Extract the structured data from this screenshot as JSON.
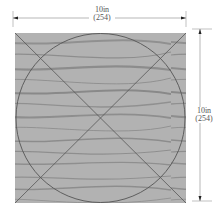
{
  "diagram": {
    "width_dimension": {
      "imperial": "10in",
      "metric": "(254)"
    },
    "height_dimension": {
      "imperial": "10in",
      "metric": "(254)"
    },
    "colors": {
      "wood_base": "#a9a9a9",
      "wood_grain": "#6e6e6e",
      "lines": "#555555",
      "dimension_lines": "#888888"
    },
    "shapes": [
      "square",
      "inscribed-circle",
      "diagonal-1",
      "diagonal-2"
    ]
  }
}
